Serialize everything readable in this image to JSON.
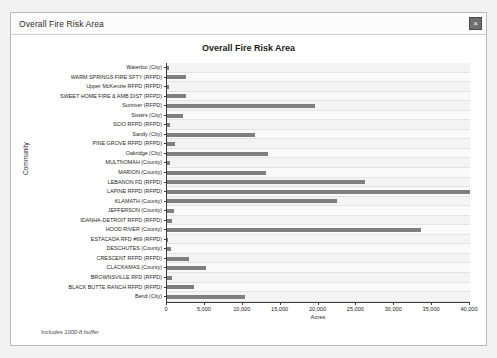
{
  "window": {
    "title": "Overall Fire Risk Area",
    "close_label": "×",
    "close_icon": "close-icon"
  },
  "chart_data": {
    "type": "bar",
    "orientation": "horizontal",
    "title": "Overall Fire Risk Area",
    "xlabel": "Acres",
    "ylabel": "Community",
    "xlim": [
      0,
      40000
    ],
    "xticks": [
      0,
      5000,
      10000,
      15000,
      20000,
      25000,
      30000,
      35000,
      40000
    ],
    "xtick_labels": [
      "0",
      "5,000",
      "10,000",
      "15,000",
      "20,000",
      "25,000",
      "30,000",
      "35,000",
      "40,000"
    ],
    "grid": true,
    "legend": "none",
    "bar_color": "#7f7f7f",
    "footnote": "Includes 1000-ft buffer",
    "categories": [
      "Waterloo (City)",
      "WARM SPRINGS FIRE SFTY (RFPD)",
      "Upper McKenzie RFPD (RFPD)",
      "SWEET HOME FIRE & AMB DIST (RFPD)",
      "Sunriver (RFPD)",
      "Sisters (City)",
      "SCIO RFPD (RFPD)",
      "Sandy (City)",
      "PINE GROVE RFPD (RFPD)",
      "Oakridge (City)",
      "MULTNOMAH (County)",
      "MARION (County)",
      "LEBANON FD (RFPD)",
      "LAPINE RFPD (RFPD)",
      "KLAMATH (County)",
      "JEFFERSON (County)",
      "IDANHA-DETROIT RFPD (RFPD)",
      "HOOD RIVER (County)",
      "ESTACADA RFD #69 (RFPD)",
      "DESCHUTES (County)",
      "CRESCENT RFPD (RFPD)",
      "CLACKAMAS (County)",
      "BROWNSVILLE RFD (RFPD)",
      "BLACK BUTTE RANCH RFPD (RFPD)",
      "Bend (City)"
    ],
    "values": [
      300,
      2550,
      300,
      2450,
      19600,
      2150,
      400,
      11600,
      1100,
      13300,
      350,
      13100,
      26200,
      40000,
      22400,
      900,
      650,
      33500,
      150,
      500,
      2900,
      5100,
      700,
      3500,
      10350
    ]
  }
}
